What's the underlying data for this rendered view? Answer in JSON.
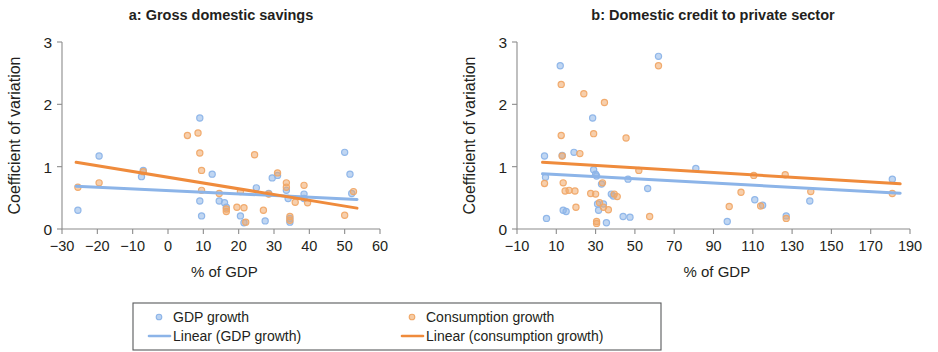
{
  "figure": {
    "width": 938,
    "height": 352,
    "background": "#ffffff"
  },
  "colors": {
    "gdp_growth": "#8cb4e8",
    "consumption_growth": "#f0a868",
    "gdp_line": "#8cb4e8",
    "consumption_line": "#ef8b3c",
    "axis": "#8c8c8c",
    "text": "#231f20",
    "legend_border": "#58595b"
  },
  "legend": {
    "items": [
      {
        "label": "GDP growth",
        "type": "marker",
        "color": "#8cb4e8"
      },
      {
        "label": "Consumption growth",
        "type": "marker",
        "color": "#f0a868"
      },
      {
        "label": "Linear (GDP growth)",
        "type": "line",
        "color": "#8cb4e8"
      },
      {
        "label": "Linear (consumption growth)",
        "type": "line",
        "color": "#ef8b3c"
      }
    ]
  },
  "chart_data": [
    {
      "type": "scatter",
      "panel": "a",
      "title": "a: Gross domestic savings",
      "xlabel": "% of GDP",
      "ylabel": "Coefficient of variation",
      "xlim": [
        -30,
        60
      ],
      "ylim": [
        0,
        3
      ],
      "xticks": [
        -30,
        -20,
        -10,
        0,
        10,
        20,
        30,
        40,
        50,
        60
      ],
      "xticklabels": [
        "−30",
        "−20",
        "−10",
        "0",
        "10",
        "20",
        "30",
        "40",
        "50",
        "60"
      ],
      "yticks": [
        0,
        1,
        2,
        3
      ],
      "yticklabels": [
        "0",
        "1",
        "2",
        "3"
      ],
      "grid": false,
      "legend_position": "below-figure",
      "series": [
        {
          "name": "GDP growth",
          "color": "#8cb4e8",
          "points": [
            [
              -25.5,
              0.3
            ],
            [
              -19.5,
              1.17
            ],
            [
              -7.5,
              0.84
            ],
            [
              -7.0,
              0.94
            ],
            [
              9.0,
              1.78
            ],
            [
              9.0,
              0.45
            ],
            [
              9.5,
              0.21
            ],
            [
              12.5,
              0.88
            ],
            [
              14.5,
              0.45
            ],
            [
              16.0,
              0.42
            ],
            [
              16.5,
              0.35
            ],
            [
              20.5,
              0.21
            ],
            [
              21.5,
              0.1
            ],
            [
              25.0,
              0.66
            ],
            [
              27.5,
              0.13
            ],
            [
              28.5,
              0.57
            ],
            [
              29.5,
              0.82
            ],
            [
              31.0,
              0.86
            ],
            [
              33.5,
              0.62
            ],
            [
              34.0,
              0.49
            ],
            [
              34.5,
              0.17
            ],
            [
              34.5,
              0.11
            ],
            [
              38.5,
              0.56
            ],
            [
              38.5,
              0.49
            ],
            [
              50.0,
              1.23
            ],
            [
              51.5,
              0.88
            ],
            [
              52.0,
              0.57
            ]
          ]
        },
        {
          "name": "Consumption growth",
          "color": "#f0a868",
          "points": [
            [
              -25.5,
              0.67
            ],
            [
              -19.5,
              0.74
            ],
            [
              -7.0,
              0.92
            ],
            [
              5.5,
              1.5
            ],
            [
              8.5,
              1.54
            ],
            [
              9.0,
              1.22
            ],
            [
              9.5,
              0.94
            ],
            [
              9.5,
              0.62
            ],
            [
              14.5,
              0.57
            ],
            [
              16.5,
              0.32
            ],
            [
              16.5,
              0.28
            ],
            [
              19.5,
              0.35
            ],
            [
              20.5,
              0.6
            ],
            [
              21.5,
              0.34
            ],
            [
              22.0,
              0.11
            ],
            [
              24.5,
              1.19
            ],
            [
              27.0,
              0.3
            ],
            [
              28.5,
              0.56
            ],
            [
              31.0,
              0.9
            ],
            [
              33.5,
              0.74
            ],
            [
              33.5,
              0.67
            ],
            [
              34.5,
              0.2
            ],
            [
              34.5,
              0.14
            ],
            [
              36.0,
              0.43
            ],
            [
              38.5,
              0.7
            ],
            [
              39.5,
              0.42
            ],
            [
              50.0,
              0.22
            ],
            [
              52.5,
              0.6
            ]
          ]
        }
      ],
      "trendlines": [
        {
          "name": "Linear (GDP growth)",
          "color": "#8cb4e8",
          "x0": -26.0,
          "y0": 0.685,
          "x1": 53.5,
          "y1": 0.475
        },
        {
          "name": "Linear (consumption growth)",
          "color": "#ef8b3c",
          "x0": -26.0,
          "y0": 1.07,
          "x1": 53.5,
          "y1": 0.335
        }
      ]
    },
    {
      "type": "scatter",
      "panel": "b",
      "title": "b: Domestic credit to private sector",
      "xlabel": "% of GDP",
      "ylabel": "Coefficient of variation",
      "xlim": [
        -10,
        190
      ],
      "ylim": [
        0,
        3
      ],
      "xticks": [
        -10,
        10,
        30,
        50,
        70,
        90,
        110,
        130,
        150,
        170,
        190
      ],
      "xticklabels": [
        "−10",
        "10",
        "30",
        "50",
        "70",
        "90",
        "110",
        "130",
        "150",
        "170",
        "190"
      ],
      "yticks": [
        0,
        1,
        2,
        3
      ],
      "yticklabels": [
        "0",
        "1",
        "2",
        "3"
      ],
      "grid": false,
      "legend_position": "below-figure",
      "series": [
        {
          "name": "GDP growth",
          "color": "#8cb4e8",
          "points": [
            [
              4.0,
              1.17
            ],
            [
              4.5,
              0.83
            ],
            [
              5.0,
              0.17
            ],
            [
              12.0,
              2.62
            ],
            [
              13.0,
              1.18
            ],
            [
              13.5,
              0.3
            ],
            [
              15.0,
              0.28
            ],
            [
              19.0,
              1.23
            ],
            [
              28.5,
              1.78
            ],
            [
              29.0,
              0.95
            ],
            [
              30.0,
              0.88
            ],
            [
              30.5,
              0.85
            ],
            [
              31.0,
              0.4
            ],
            [
              31.5,
              0.3
            ],
            [
              33.0,
              0.72
            ],
            [
              34.0,
              0.4
            ],
            [
              35.5,
              0.1
            ],
            [
              38.0,
              0.56
            ],
            [
              39.0,
              0.53
            ],
            [
              44.0,
              0.2
            ],
            [
              46.5,
              0.8
            ],
            [
              47.5,
              0.19
            ],
            [
              62.0,
              2.77
            ],
            [
              56.5,
              0.65
            ],
            [
              81.0,
              0.97
            ],
            [
              97.0,
              0.12
            ],
            [
              111.0,
              0.47
            ],
            [
              115.0,
              0.38
            ],
            [
              127.0,
              0.21
            ],
            [
              139.0,
              0.45
            ],
            [
              181.0,
              0.8
            ]
          ]
        },
        {
          "name": "Consumption growth",
          "color": "#f0a868",
          "points": [
            [
              4.0,
              0.73
            ],
            [
              12.5,
              2.32
            ],
            [
              12.5,
              1.5
            ],
            [
              13.0,
              1.17
            ],
            [
              13.5,
              0.74
            ],
            [
              14.5,
              0.61
            ],
            [
              16.5,
              0.62
            ],
            [
              19.5,
              0.61
            ],
            [
              20.0,
              0.35
            ],
            [
              22.0,
              1.21
            ],
            [
              24.0,
              2.17
            ],
            [
              27.5,
              0.57
            ],
            [
              29.0,
              1.53
            ],
            [
              30.0,
              0.56
            ],
            [
              30.5,
              0.12
            ],
            [
              30.5,
              0.09
            ],
            [
              32.0,
              0.42
            ],
            [
              33.5,
              0.74
            ],
            [
              34.0,
              0.35
            ],
            [
              34.5,
              2.03
            ],
            [
              36.5,
              0.31
            ],
            [
              39.5,
              0.56
            ],
            [
              41.0,
              0.52
            ],
            [
              45.5,
              1.46
            ],
            [
              52.0,
              0.94
            ],
            [
              57.5,
              0.2
            ],
            [
              62.0,
              2.62
            ],
            [
              98.0,
              0.36
            ],
            [
              104.0,
              0.59
            ],
            [
              110.5,
              0.86
            ],
            [
              114.0,
              0.37
            ],
            [
              126.5,
              0.87
            ],
            [
              127.0,
              0.17
            ],
            [
              139.5,
              0.6
            ],
            [
              181.0,
              0.57
            ]
          ]
        }
      ],
      "trendlines": [
        {
          "name": "Linear (GDP growth)",
          "color": "#8cb4e8",
          "x0": 3.0,
          "y0": 0.885,
          "x1": 185.0,
          "y1": 0.575
        },
        {
          "name": "Linear (consumption growth)",
          "color": "#ef8b3c",
          "x0": 3.0,
          "y0": 1.07,
          "x1": 185.0,
          "y1": 0.725
        }
      ]
    }
  ],
  "geometry": {
    "panel_a": {
      "left": 62,
      "right": 380,
      "top": 42,
      "bottom": 229,
      "title_x": 221,
      "title_y": 20
    },
    "panel_b": {
      "left": 517,
      "right": 910,
      "top": 42,
      "bottom": 229,
      "title_x": 713,
      "title_y": 20
    },
    "legend": {
      "x": 133,
      "y": 303,
      "width": 528,
      "height": 47
    }
  }
}
